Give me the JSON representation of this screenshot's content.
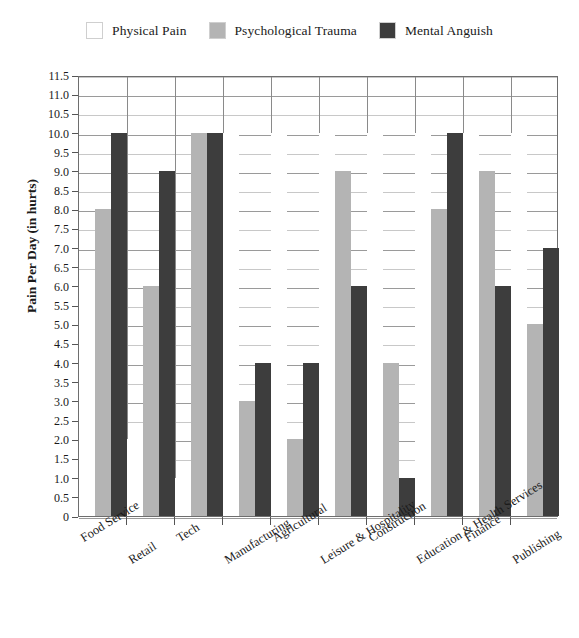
{
  "legend": {
    "position": "top-center",
    "items": [
      {
        "label": "Physical Pain",
        "color": "#ffffff",
        "swatch_name": "legend-swatch-physical-pain"
      },
      {
        "label": "Psychological Trauma",
        "color": "#b4b4b4",
        "swatch_name": "legend-swatch-psychological-trauma"
      },
      {
        "label": "Mental Anguish",
        "color": "#3d3d3d",
        "swatch_name": "legend-swatch-mental-anguish"
      }
    ]
  },
  "axes": {
    "y_title": "Pain Per Day (in hurts)",
    "y_ticks": [
      "0",
      "0.5",
      "1.0",
      "1.5",
      "2.0",
      "2.5",
      "3.0",
      "3.5",
      "4.0",
      "4.5",
      "5.0",
      "5.5",
      "6.0",
      "6.5",
      "7.0",
      "7.5",
      "8.0",
      "8.5",
      "9.0",
      "9.5",
      "10.0",
      "10.5",
      "11.0",
      "11.5"
    ],
    "x_title": ""
  },
  "chart_data": {
    "type": "bar",
    "title": "",
    "subtitle": "",
    "xlabel": "",
    "ylabel": "Pain Per Day (in hurts)",
    "ylim": [
      0,
      11.5
    ],
    "ytick_step": 0.5,
    "grid": true,
    "legend_position": "top-center",
    "categories": [
      "Food Service",
      "Retail",
      "Tech",
      "Manufacturing",
      "Agricultural",
      "Leisure & Hospitality",
      "Construction",
      "Education & Health Services",
      "Finance",
      "Publishing"
    ],
    "series": [
      {
        "name": "Physical Pain",
        "color": "#ffffff",
        "values": [
          6.0,
          2.0,
          1.0,
          10.0,
          10.0,
          10.0,
          10.0,
          10.0,
          10.0,
          10.0
        ]
      },
      {
        "name": "Psychological Trauma",
        "color": "#b4b4b4",
        "values": [
          8.0,
          6.0,
          10.0,
          3.0,
          2.0,
          9.0,
          4.0,
          8.0,
          9.0,
          5.0
        ]
      },
      {
        "name": "Mental Anguish",
        "color": "#3d3d3d",
        "values": [
          10.0,
          9.0,
          10.0,
          4.0,
          4.0,
          6.0,
          1.0,
          10.0,
          6.0,
          7.0
        ]
      }
    ]
  }
}
